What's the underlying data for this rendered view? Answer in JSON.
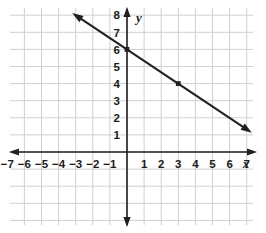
{
  "figure": {
    "kind": "coordinate-plane-line-graph",
    "background_color": "#ffffff",
    "grid_color": "#cfcfd4",
    "axis_color": "#231f20",
    "line_color": "#231f20"
  },
  "axes": {
    "x_axis_label": "x",
    "y_axis_label": "y",
    "x_tick_labels": [
      "-7",
      "-6",
      "-5",
      "-4",
      "-3",
      "-2",
      "-1",
      "1",
      "2",
      "3",
      "4",
      "5",
      "6",
      "7"
    ],
    "y_tick_labels": [
      "1",
      "2",
      "3",
      "4",
      "5",
      "6",
      "7",
      "8"
    ],
    "x_arrow_left": true,
    "x_arrow_right": true,
    "y_arrow_up": true,
    "y_arrow_down": true
  },
  "chart_data": {
    "type": "line",
    "title": "",
    "xlabel": "x",
    "ylabel": "y",
    "xlim": [
      -7.6,
      7.7
    ],
    "ylim": [
      -4.4,
      8.6
    ],
    "grid": true,
    "legend": "none",
    "x_ticks": [
      -7,
      -6,
      -5,
      -4,
      -3,
      -2,
      -1,
      1,
      2,
      3,
      4,
      5,
      6,
      7
    ],
    "y_ticks": [
      1,
      2,
      3,
      4,
      5,
      6,
      7,
      8
    ],
    "series": [
      {
        "name": "line",
        "slope": -0.6667,
        "intercept": 6,
        "equation": "y = -2/3 x + 6",
        "x": [
          -3.2,
          7.3
        ],
        "values": [
          8.13,
          1.13
        ],
        "arrow_start": true,
        "arrow_end": true,
        "marked_points": [
          {
            "x": 0,
            "y": 6
          },
          {
            "x": 3,
            "y": 4
          }
        ]
      }
    ]
  }
}
